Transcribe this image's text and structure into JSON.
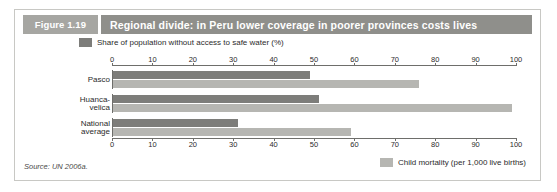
{
  "figure": {
    "number_label": "Figure 1.19",
    "title": "Regional divide: in Peru lower coverage in poorer provinces costs lives",
    "source": "Source: UN 2006a."
  },
  "legend": {
    "top": {
      "label": "Share of population without access to safe water (%)",
      "color": "#7d7d7a",
      "swatch_name": "water-legend-swatch"
    },
    "bottom": {
      "label": "Child mortality (per 1,000 live births)",
      "color": "#b6b6b2",
      "swatch_name": "mortality-legend-swatch"
    }
  },
  "chart_data": {
    "type": "bar",
    "orientation": "horizontal",
    "title": "Regional divide: in Peru lower coverage in poorer provinces costs lives",
    "xlabel": "",
    "ylabel": "",
    "xlim": [
      0,
      100
    ],
    "xticks": [
      0,
      10,
      20,
      30,
      40,
      50,
      60,
      70,
      80,
      90,
      100
    ],
    "xtick_labels": [
      "0",
      "10",
      "20",
      "30",
      "40",
      "50",
      "60",
      "70",
      "80",
      "90",
      "100"
    ],
    "axis_positions": [
      "top",
      "bottom"
    ],
    "grid": false,
    "legend_position": "top-left and bottom-right",
    "categories": [
      "Pasco",
      "Huanca-velica",
      "National average"
    ],
    "category_label_lines": [
      [
        "Pasco"
      ],
      [
        "Huanca-",
        "velica"
      ],
      [
        "National",
        "average"
      ]
    ],
    "series": [
      {
        "name": "Share of population without access to safe water (%)",
        "color": "#7d7d7a",
        "values": [
          49,
          51,
          31
        ]
      },
      {
        "name": "Child mortality (per 1,000 live births)",
        "color": "#b6b6b2",
        "values": [
          76,
          99,
          59
        ]
      }
    ]
  }
}
